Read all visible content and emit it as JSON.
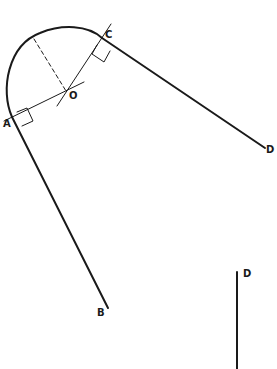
{
  "diagram": {
    "type": "geometric construction",
    "colors": {
      "stroke": "#1a1a1a",
      "background": "#ffffff"
    },
    "points": {
      "O": {
        "label": "O",
        "x": 66,
        "y": 91
      },
      "A": {
        "label": "A",
        "x": 12,
        "y": 117
      },
      "C": {
        "label": "C",
        "x": 102,
        "y": 38
      },
      "D": {
        "label": "D",
        "x": 265,
        "y": 148
      },
      "B": {
        "label": "B",
        "x": 108,
        "y": 308
      }
    },
    "separate_line": {
      "label": "D",
      "x": 237,
      "y1": 272,
      "y2": 369
    },
    "elements": [
      "arc from A to C centered at O",
      "tangent line A to B",
      "tangent line C to D",
      "radius line through A and O extended",
      "radius line through C and O extended",
      "dashed radius from O to arc",
      "right-angle mark at A",
      "right-angle mark at C"
    ]
  }
}
